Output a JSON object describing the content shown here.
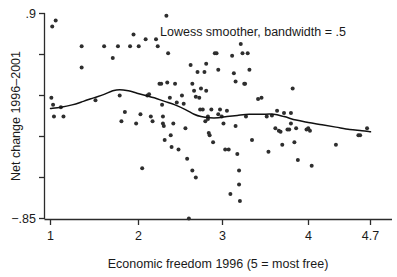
{
  "chart_data": {
    "type": "scatter",
    "title": "",
    "annotation": "Lowess smoother, bandwidth = .5",
    "xlabel": "Economic freedom 1996 (5 = most free)",
    "ylabel": "Net change 1996–2001",
    "xlim": [
      1.0,
      4.7
    ],
    "ylim": [
      -0.85,
      0.9
    ],
    "grid": false,
    "legend": "none",
    "xticks": [
      1,
      2,
      3,
      4,
      4.7
    ],
    "xtick_labels": [
      "1",
      "2",
      "3",
      "4",
      "4.7"
    ],
    "yticks": [
      0.9,
      -0.85
    ],
    "ytick_labels": [
      ".9",
      "−.85"
    ],
    "y_minor_tick_count": 4,
    "marker": "open-circle",
    "point_count": 128,
    "points": [
      [
        1.02,
        0.79
      ],
      [
        1.06,
        0.84
      ],
      [
        1.01,
        0.18
      ],
      [
        1.03,
        0.12
      ],
      [
        1.04,
        0.02
      ],
      [
        1.12,
        0.1
      ],
      [
        1.15,
        0.02
      ],
      [
        1.36,
        0.62
      ],
      [
        1.36,
        0.44
      ],
      [
        1.52,
        0.16
      ],
      [
        1.62,
        0.62
      ],
      [
        1.72,
        0.52
      ],
      [
        1.78,
        0.62
      ],
      [
        1.8,
        0.2
      ],
      [
        1.82,
        -0.02
      ],
      [
        1.86,
        0.06
      ],
      [
        1.92,
        0.62
      ],
      [
        1.96,
        0.72
      ],
      [
        1.99,
        -0.04
      ],
      [
        2.02,
        0.62
      ],
      [
        2.04,
        0.04
      ],
      [
        2.06,
        -0.42
      ],
      [
        2.1,
        0.68
      ],
      [
        2.12,
        0.2
      ],
      [
        2.14,
        0.21
      ],
      [
        2.16,
        0.02
      ],
      [
        2.18,
        -0.02
      ],
      [
        2.22,
        0.68
      ],
      [
        2.24,
        0.62
      ],
      [
        2.26,
        0.3
      ],
      [
        2.28,
        0.3
      ],
      [
        2.29,
        0.12
      ],
      [
        2.3,
        0.02
      ],
      [
        2.3,
        -0.04
      ],
      [
        2.31,
        -0.06
      ],
      [
        2.32,
        -0.18
      ],
      [
        2.34,
        0.88
      ],
      [
        2.35,
        0.31
      ],
      [
        2.36,
        0.56
      ],
      [
        2.38,
        0.18
      ],
      [
        2.39,
        -0.14
      ],
      [
        2.4,
        -0.24
      ],
      [
        2.42,
        -0.04
      ],
      [
        2.44,
        0.3
      ],
      [
        2.46,
        0.14
      ],
      [
        2.48,
        -0.26
      ],
      [
        2.52,
        0.2
      ],
      [
        2.54,
        0.13
      ],
      [
        2.56,
        -0.08
      ],
      [
        2.58,
        -0.34
      ],
      [
        2.6,
        -0.85
      ],
      [
        2.62,
        0.46
      ],
      [
        2.64,
        0.3
      ],
      [
        2.64,
        -0.44
      ],
      [
        2.66,
        0.24
      ],
      [
        2.68,
        0.19
      ],
      [
        2.68,
        -0.5
      ],
      [
        2.7,
        0.4
      ],
      [
        2.72,
        0.18
      ],
      [
        2.73,
        0.08
      ],
      [
        2.74,
        0.26
      ],
      [
        2.76,
        0.08
      ],
      [
        2.78,
        0.4
      ],
      [
        2.79,
        -0.02
      ],
      [
        2.8,
        0.47
      ],
      [
        2.8,
        0.24
      ],
      [
        2.82,
        0.02
      ],
      [
        2.82,
        0.0
      ],
      [
        2.83,
        -0.12
      ],
      [
        2.84,
        -0.14
      ],
      [
        2.86,
        0.08
      ],
      [
        2.88,
        -0.2
      ],
      [
        2.9,
        0.56
      ],
      [
        2.92,
        0.56
      ],
      [
        2.94,
        0.42
      ],
      [
        2.94,
        0.04
      ],
      [
        2.96,
        0.08
      ],
      [
        2.98,
        0.02
      ],
      [
        3.0,
        -0.04
      ],
      [
        3.02,
        -0.26
      ],
      [
        3.04,
        0.07
      ],
      [
        3.06,
        -0.26
      ],
      [
        3.08,
        -0.64
      ],
      [
        3.1,
        0.54
      ],
      [
        3.12,
        0.39
      ],
      [
        3.14,
        0.32
      ],
      [
        3.14,
        -0.06
      ],
      [
        3.16,
        -0.3
      ],
      [
        3.18,
        -0.44
      ],
      [
        3.18,
        -0.56
      ],
      [
        3.19,
        -0.7
      ],
      [
        3.2,
        0.64
      ],
      [
        3.22,
        0.56
      ],
      [
        3.24,
        0.3
      ],
      [
        3.25,
        0.3
      ],
      [
        3.26,
        0.02
      ],
      [
        3.28,
        0.56
      ],
      [
        3.3,
        0.42
      ],
      [
        3.33,
        -0.18
      ],
      [
        3.4,
        0.17
      ],
      [
        3.44,
        0.18
      ],
      [
        3.5,
        0.02
      ],
      [
        3.52,
        -0.28
      ],
      [
        3.56,
        0.03
      ],
      [
        3.6,
        -0.08
      ],
      [
        3.62,
        0.07
      ],
      [
        3.64,
        -0.1
      ],
      [
        3.66,
        -0.11
      ],
      [
        3.68,
        -0.22
      ],
      [
        3.7,
        0.05
      ],
      [
        3.74,
        -0.09
      ],
      [
        3.76,
        -0.09
      ],
      [
        3.78,
        0.05
      ],
      [
        3.78,
        -0.04
      ],
      [
        3.8,
        0.26
      ],
      [
        3.82,
        -0.2
      ],
      [
        3.84,
        -0.08
      ],
      [
        3.86,
        -0.35
      ],
      [
        3.96,
        -0.09
      ],
      [
        3.98,
        -0.08
      ],
      [
        4.0,
        -0.1
      ],
      [
        4.02,
        -0.4
      ],
      [
        4.3,
        -0.22
      ],
      [
        4.56,
        -0.14
      ],
      [
        4.58,
        -0.14
      ],
      [
        4.66,
        -0.08
      ]
    ],
    "lowess_curve": [
      [
        1.0,
        0.09
      ],
      [
        1.12,
        0.1
      ],
      [
        1.25,
        0.12
      ],
      [
        1.38,
        0.15
      ],
      [
        1.5,
        0.18
      ],
      [
        1.62,
        0.21
      ],
      [
        1.72,
        0.24
      ],
      [
        1.8,
        0.25
      ],
      [
        1.9,
        0.24
      ],
      [
        2.0,
        0.22
      ],
      [
        2.1,
        0.2
      ],
      [
        2.2,
        0.18
      ],
      [
        2.32,
        0.15
      ],
      [
        2.44,
        0.12
      ],
      [
        2.56,
        0.08
      ],
      [
        2.66,
        0.04
      ],
      [
        2.74,
        0.02
      ],
      [
        2.84,
        0.01
      ],
      [
        2.94,
        0.01
      ],
      [
        3.04,
        0.02
      ],
      [
        3.16,
        0.03
      ],
      [
        3.3,
        0.04
      ],
      [
        3.44,
        0.04
      ],
      [
        3.58,
        0.04
      ],
      [
        3.7,
        0.02
      ],
      [
        3.84,
        -0.01
      ],
      [
        3.98,
        -0.03
      ],
      [
        4.14,
        -0.05
      ],
      [
        4.3,
        -0.07
      ],
      [
        4.46,
        -0.09
      ],
      [
        4.6,
        -0.1
      ],
      [
        4.7,
        -0.11
      ]
    ]
  },
  "axes": {
    "y_top_label": ".9",
    "y_bottom_label": "−.85",
    "y_title": "Net change 1996–2001",
    "x_title": "Economic freedom 1996 (5 = most free)",
    "x_labels": [
      "1",
      "2",
      "3",
      "4",
      "4.7"
    ]
  },
  "annotation": {
    "text": "Lowess smoother, bandwidth = .5"
  },
  "colors": {
    "point": "#2e2e2e",
    "curve": "#111111",
    "axis": "#2b2b2b",
    "text": "#1a1a1a",
    "background": "#ffffff"
  }
}
